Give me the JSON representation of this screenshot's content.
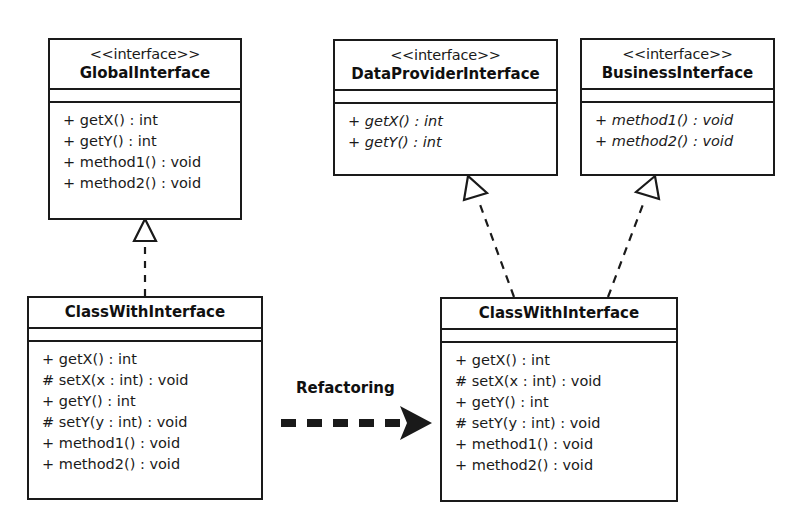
{
  "diagram": {
    "background_color": "#ffffff",
    "line_color": "#1a1a1a",
    "text_color": "#1a1a1a"
  },
  "nodes": {
    "global_interface": {
      "stereotype": "<<interface>>",
      "name": "GlobalInterface",
      "attributes": [],
      "methods": [
        {
          "text": "+ getX() : int",
          "abstract": false
        },
        {
          "text": "+ getY() : int",
          "abstract": false
        },
        {
          "text": "+ method1() : void",
          "abstract": false
        },
        {
          "text": "+ method2() : void",
          "abstract": false
        }
      ]
    },
    "data_provider_interface": {
      "stereotype": "<<interface>>",
      "name": "DataProviderInterface",
      "attributes": [],
      "methods": [
        {
          "text": "+ getX() : int",
          "abstract": true
        },
        {
          "text": "+ getY() : int",
          "abstract": true
        }
      ]
    },
    "business_interface": {
      "stereotype": "<<interface>>",
      "name": "BusinessInterface",
      "attributes": [],
      "methods": [
        {
          "text": "+ method1() : void",
          "abstract": true
        },
        {
          "text": "+ method2() : void",
          "abstract": true
        }
      ]
    },
    "class_before": {
      "stereotype": "",
      "name": "ClassWithInterface",
      "attributes": [],
      "methods": [
        {
          "text": "+ getX() : int",
          "abstract": false
        },
        {
          "text": "# setX(x : int) : void",
          "abstract": false
        },
        {
          "text": "+ getY() : int",
          "abstract": false
        },
        {
          "text": "# setY(y : int) : void",
          "abstract": false
        },
        {
          "text": "+ method1() : void",
          "abstract": false
        },
        {
          "text": "+ method2() : void",
          "abstract": false
        }
      ]
    },
    "class_after": {
      "stereotype": "",
      "name": "ClassWithInterface",
      "attributes": [],
      "methods": [
        {
          "text": "+ getX() : int",
          "abstract": false
        },
        {
          "text": "# setX(x : int) : void",
          "abstract": false
        },
        {
          "text": "+ getY() : int",
          "abstract": false
        },
        {
          "text": "# setY(y : int) : void",
          "abstract": false
        },
        {
          "text": "+ method1() : void",
          "abstract": false
        },
        {
          "text": "+ method2() : void",
          "abstract": false
        }
      ]
    }
  },
  "edges": [
    {
      "id": "realize-global",
      "type": "realization",
      "style": "dashed",
      "arrowhead": "hollow-triangle",
      "from": "class_before",
      "to": "global_interface",
      "label": ""
    },
    {
      "id": "realize-data-provider",
      "type": "realization",
      "style": "dashed",
      "arrowhead": "hollow-triangle",
      "from": "class_after",
      "to": "data_provider_interface",
      "label": ""
    },
    {
      "id": "realize-business",
      "type": "realization",
      "style": "dashed",
      "arrowhead": "hollow-triangle",
      "from": "class_after",
      "to": "business_interface",
      "label": ""
    },
    {
      "id": "refactoring-arrow",
      "type": "transformation",
      "style": "thick-dashed",
      "arrowhead": "solid-arrow",
      "from": "class_before",
      "to": "class_after",
      "label": "Refactoring"
    }
  ],
  "labels": {
    "refactoring": "Refactoring"
  }
}
